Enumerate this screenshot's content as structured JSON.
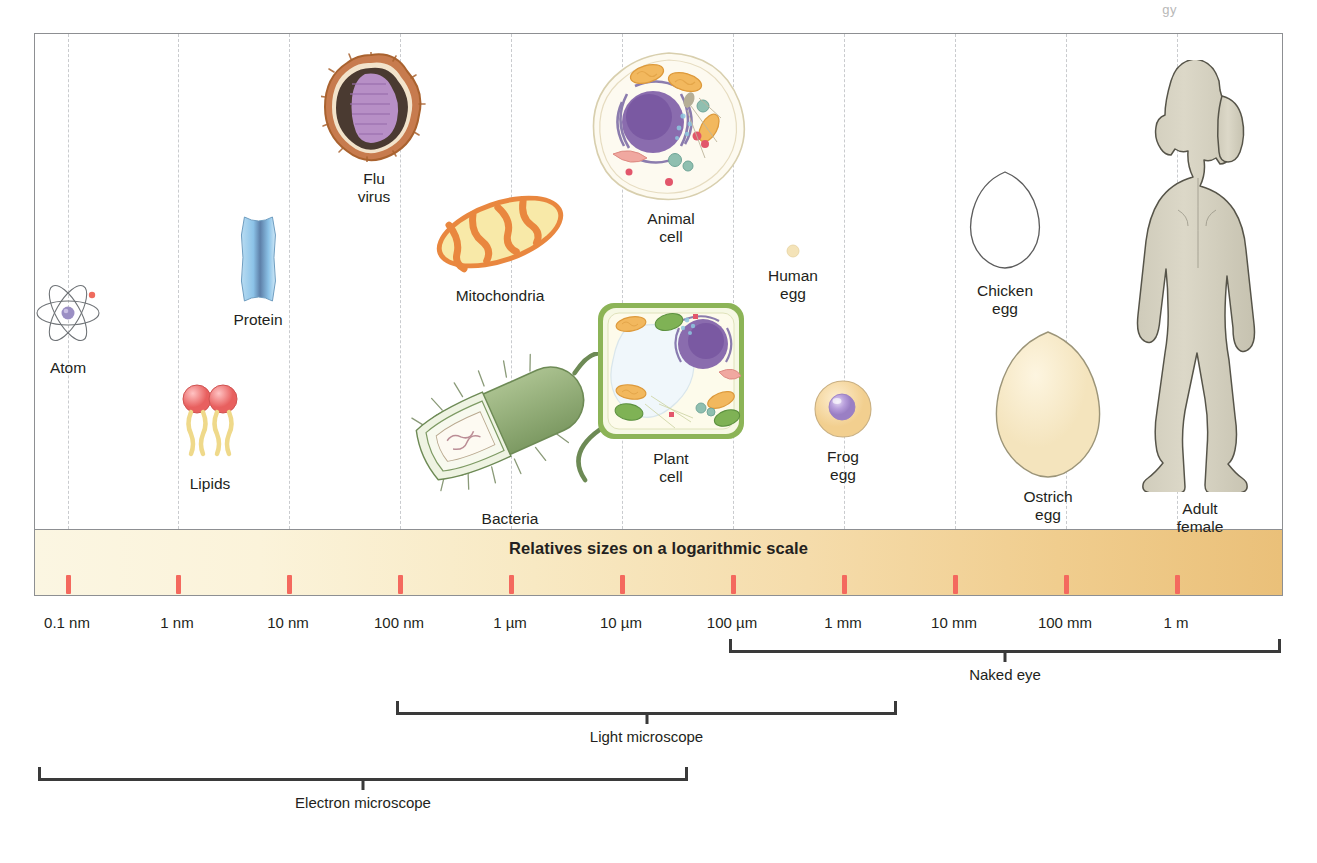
{
  "page_fragment": "gy",
  "scale": {
    "title": "Relatives sizes on a logarithmic scale",
    "ticks": [
      {
        "label": "0.1 nm",
        "x": 67
      },
      {
        "label": "1 nm",
        "x": 177
      },
      {
        "label": "10 nm",
        "x": 288
      },
      {
        "label": "100 nm",
        "x": 399
      },
      {
        "label": "1 µm",
        "x": 510
      },
      {
        "label": "10 µm",
        "x": 621
      },
      {
        "label": "100 µm",
        "x": 732
      },
      {
        "label": "1 mm",
        "x": 843
      },
      {
        "label": "10 mm",
        "x": 954
      },
      {
        "label": "100 mm",
        "x": 1065
      },
      {
        "label": "1 m",
        "x": 1176
      }
    ]
  },
  "brackets": [
    {
      "name": "naked-eye",
      "label": "Naked eye",
      "left": 729,
      "right": 1281,
      "top": 650
    },
    {
      "name": "light-microscope",
      "label": "Light microscope",
      "left": 396,
      "right": 897,
      "top": 712
    },
    {
      "name": "electron-microscope",
      "label": "Electron microscope",
      "left": 38,
      "right": 688,
      "top": 778
    }
  ],
  "specimens": [
    {
      "name": "atom",
      "label": "Atom",
      "x": 68,
      "y": 275,
      "art": "atom"
    },
    {
      "name": "lipids",
      "label": "Lipids",
      "x": 210,
      "y": 383,
      "art": "lipids"
    },
    {
      "name": "protein",
      "label": "Protein",
      "x": 258,
      "y": 215,
      "art": "protein"
    },
    {
      "name": "flu-virus",
      "label": "Flu\nvirus",
      "x": 374,
      "y": 52,
      "art": "virus"
    },
    {
      "name": "mitochondria",
      "label": "Mitochondria",
      "x": 500,
      "y": 185,
      "art": "mitochondria"
    },
    {
      "name": "bacteria",
      "label": "Bacteria",
      "x": 510,
      "y": 352,
      "art": "bacteria"
    },
    {
      "name": "animal-cell",
      "label": "Animal\ncell",
      "x": 671,
      "y": 50,
      "art": "animalcell"
    },
    {
      "name": "plant-cell",
      "label": "Plant\ncell",
      "x": 671,
      "y": 300,
      "art": "plantcell"
    },
    {
      "name": "human-egg",
      "label": "Human\negg",
      "x": 793,
      "y": 243,
      "art": "humanegg"
    },
    {
      "name": "frog-egg",
      "label": "Frog\negg",
      "x": 843,
      "y": 378,
      "art": "frogegg"
    },
    {
      "name": "chicken-egg",
      "label": "Chicken\negg",
      "x": 1005,
      "y": 170,
      "art": "chickenegg"
    },
    {
      "name": "ostrich-egg",
      "label": "Ostrich\negg",
      "x": 1048,
      "y": 330,
      "art": "ostrichegg"
    },
    {
      "name": "adult-female",
      "label": "Adult\nfemale",
      "x": 1200,
      "y": 60,
      "art": "female"
    }
  ],
  "colors": {
    "tick": "#f4695e",
    "scalebar_start": "#fbf6e2",
    "scalebar_end": "#eac079",
    "panel_border": "#8d8f92",
    "gridline": "#c9cbce",
    "text": "#231f20",
    "bracket": "#3a3a3a"
  },
  "chart_data": {
    "type": "table",
    "title": "Relatives sizes on a logarithmic scale",
    "xlabel": "",
    "ylabel": "",
    "axis_type": "log10",
    "tick_labels": [
      "0.1 nm",
      "1 nm",
      "10 nm",
      "100 nm",
      "1 µm",
      "10 µm",
      "100 µm",
      "1 mm",
      "10 mm",
      "100 mm",
      "1 m"
    ],
    "tick_values_m": [
      1e-10,
      1e-09,
      1e-08,
      1e-07,
      1e-06,
      1e-05,
      0.0001,
      0.001,
      0.01,
      0.1,
      1
    ],
    "categories": [
      "Atom",
      "Lipids",
      "Protein",
      "Flu virus",
      "Mitochondria",
      "Bacteria",
      "Animal cell",
      "Plant cell",
      "Human egg",
      "Frog egg",
      "Chicken egg",
      "Ostrich egg",
      "Adult female"
    ],
    "approx_size_m": [
      1e-10,
      3e-09,
      5e-09,
      1e-07,
      1.5e-06,
      1.5e-06,
      2e-05,
      3e-05,
      0.0001,
      0.0015,
      0.05,
      0.15,
      1.6
    ],
    "ranges": [
      {
        "name": "Electron microscope",
        "from": "0.1 nm",
        "to": "~1 mm"
      },
      {
        "name": "Light microscope",
        "from": "100 nm",
        "to": "~1 mm"
      },
      {
        "name": "Naked eye",
        "from": "100 µm",
        "to": "> 1 m"
      }
    ],
    "grid": true,
    "legend_position": "none"
  }
}
